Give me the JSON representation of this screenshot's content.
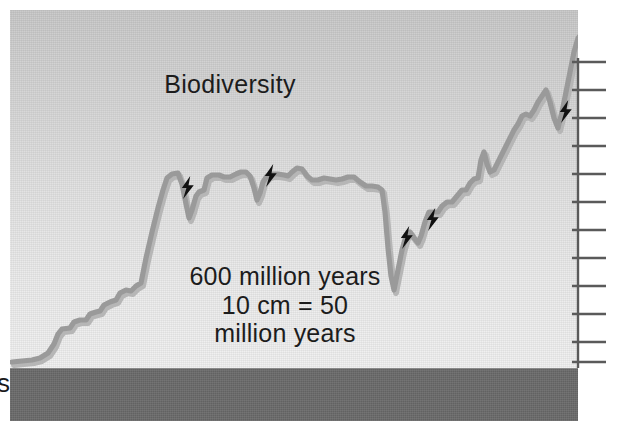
{
  "figure": {
    "title": "Biodiversity",
    "caption_lines": [
      "600 million years",
      "10 cm = 50",
      "million years"
    ],
    "edge_fragment": "s",
    "colors": {
      "panel_top": "#c7c7c7",
      "panel_bottom": "#f0f0f0",
      "curve": "#9a9a9a",
      "curve_shadow": "#b4b4b4",
      "ground_bar": "#6a6a6a",
      "axis": "#5a5a5a",
      "text": "#1c1c1c",
      "bolt": "#111111"
    },
    "axis": {
      "orientation": "vertical-right",
      "x": 578,
      "top": 58,
      "bottom": 368,
      "tick_length": 34,
      "tick_count": 12,
      "tick_y": [
        62,
        90,
        118,
        146,
        174,
        202,
        230,
        258,
        286,
        314,
        342,
        362
      ]
    },
    "ground": {
      "top": 368,
      "height": 52
    }
  },
  "chart_data": {
    "type": "line",
    "title": "Biodiversity",
    "xlabel": "",
    "ylabel": "Biodiversity",
    "annotations": [
      "600 million years",
      "10 cm = 50",
      "million years"
    ],
    "scale_note": "10 cm = 50 million years",
    "span_million_years": 600,
    "grid": false,
    "legend": null,
    "xlim": [
      0,
      600
    ],
    "ylim": [
      0,
      100
    ],
    "extinction_marker": "lightning-bolt",
    "extinction_events": [
      {
        "id": 1,
        "x": 179,
        "y": 176
      },
      {
        "id": 2,
        "x": 262,
        "y": 164
      },
      {
        "id": 3,
        "x": 398,
        "y": 226
      },
      {
        "id": 4,
        "x": 424,
        "y": 208
      },
      {
        "id": 5,
        "x": 557,
        "y": 100
      }
    ],
    "points": [
      [
        12,
        362
      ],
      [
        22,
        361
      ],
      [
        32,
        360
      ],
      [
        40,
        358
      ],
      [
        48,
        353
      ],
      [
        54,
        344
      ],
      [
        58,
        334
      ],
      [
        62,
        329
      ],
      [
        70,
        328
      ],
      [
        74,
        322
      ],
      [
        80,
        320
      ],
      [
        86,
        320
      ],
      [
        90,
        314
      ],
      [
        96,
        312
      ],
      [
        100,
        311
      ],
      [
        104,
        305
      ],
      [
        110,
        302
      ],
      [
        116,
        300
      ],
      [
        120,
        293
      ],
      [
        126,
        290
      ],
      [
        131,
        291
      ],
      [
        136,
        286
      ],
      [
        141,
        283
      ],
      [
        146,
        258
      ],
      [
        152,
        232
      ],
      [
        158,
        208
      ],
      [
        163,
        190
      ],
      [
        167,
        178
      ],
      [
        172,
        174
      ],
      [
        178,
        173
      ],
      [
        182,
        184
      ],
      [
        186,
        204
      ],
      [
        189,
        218
      ],
      [
        192,
        210
      ],
      [
        196,
        196
      ],
      [
        199,
        192
      ],
      [
        204,
        190
      ],
      [
        207,
        178
      ],
      [
        212,
        175
      ],
      [
        219,
        175
      ],
      [
        224,
        177
      ],
      [
        230,
        177
      ],
      [
        236,
        174
      ],
      [
        241,
        172
      ],
      [
        246,
        172
      ],
      [
        250,
        176
      ],
      [
        254,
        188
      ],
      [
        257,
        200
      ],
      [
        260,
        193
      ],
      [
        263,
        182
      ],
      [
        267,
        176
      ],
      [
        272,
        174
      ],
      [
        278,
        174
      ],
      [
        284,
        175
      ],
      [
        288,
        176
      ],
      [
        292,
        172
      ],
      [
        297,
        168
      ],
      [
        302,
        169
      ],
      [
        307,
        176
      ],
      [
        312,
        180
      ],
      [
        318,
        180
      ],
      [
        324,
        178
      ],
      [
        330,
        179
      ],
      [
        336,
        180
      ],
      [
        342,
        179
      ],
      [
        348,
        177
      ],
      [
        354,
        177
      ],
      [
        360,
        182
      ],
      [
        366,
        186
      ],
      [
        372,
        186
      ],
      [
        378,
        187
      ],
      [
        382,
        190
      ],
      [
        385,
        212
      ],
      [
        388,
        248
      ],
      [
        391,
        276
      ],
      [
        394,
        290
      ],
      [
        398,
        270
      ],
      [
        402,
        250
      ],
      [
        406,
        236
      ],
      [
        410,
        232
      ],
      [
        414,
        238
      ],
      [
        418,
        243
      ],
      [
        421,
        236
      ],
      [
        425,
        222
      ],
      [
        429,
        212
      ],
      [
        433,
        212
      ],
      [
        438,
        212
      ],
      [
        442,
        206
      ],
      [
        447,
        202
      ],
      [
        452,
        202
      ],
      [
        457,
        196
      ],
      [
        462,
        190
      ],
      [
        466,
        190
      ],
      [
        470,
        183
      ],
      [
        474,
        179
      ],
      [
        478,
        178
      ],
      [
        481,
        160
      ],
      [
        484,
        152
      ],
      [
        487,
        164
      ],
      [
        490,
        172
      ],
      [
        494,
        170
      ],
      [
        498,
        162
      ],
      [
        502,
        154
      ],
      [
        506,
        146
      ],
      [
        510,
        138
      ],
      [
        514,
        130
      ],
      [
        518,
        124
      ],
      [
        522,
        116
      ],
      [
        526,
        114
      ],
      [
        530,
        116
      ],
      [
        534,
        110
      ],
      [
        538,
        102
      ],
      [
        542,
        96
      ],
      [
        546,
        90
      ],
      [
        550,
        102
      ],
      [
        554,
        118
      ],
      [
        558,
        128
      ],
      [
        562,
        112
      ],
      [
        566,
        92
      ],
      [
        570,
        72
      ],
      [
        574,
        52
      ],
      [
        578,
        38
      ],
      [
        584,
        32
      ],
      [
        590,
        30
      ],
      [
        600,
        30
      ]
    ]
  }
}
